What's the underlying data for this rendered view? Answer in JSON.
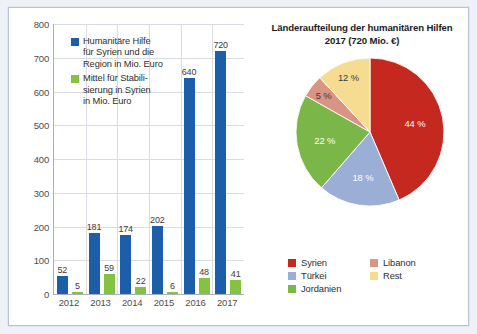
{
  "colors": {
    "blue": "#1c5fa8",
    "green": "#84c341",
    "pie_syrien": "#c4281f",
    "pie_tuerkei": "#9aaed6",
    "pie_jordanien": "#7ab648",
    "pie_libanon": "#d99484",
    "pie_rest": "#f6dc91",
    "grid": "#d9dce2",
    "axis": "#aab0bb"
  },
  "bar_chart": {
    "legend": [
      {
        "key": "humanitaere_hilfe",
        "color_key": "blue",
        "label": "Humanitäre Hilfe\nfür Syrien und die\nRegion in Mio. Euro"
      },
      {
        "key": "stabilisierung",
        "color_key": "green",
        "label": "Mittel für Stabili-\nsierung in Syrien\nin Mio. Euro"
      }
    ],
    "y_ticks": [
      "0",
      "100",
      "200",
      "300",
      "400",
      "500",
      "600",
      "700",
      "800"
    ],
    "x_ticks": [
      "2012",
      "2013",
      "2014",
      "2015",
      "2016",
      "2017"
    ]
  },
  "chart_data": [
    {
      "type": "bar",
      "title": "",
      "xlabel": "",
      "ylabel": "Mio. Euro",
      "ylim": [
        0,
        800
      ],
      "ytick_step": 100,
      "grid": true,
      "legend_position": "inside-top-left",
      "categories": [
        "2012",
        "2013",
        "2014",
        "2015",
        "2016",
        "2017"
      ],
      "series": [
        {
          "name": "Humanitäre Hilfe für Syrien und die Region in Mio. Euro",
          "color": "#1c5fa8",
          "values": [
            52,
            181,
            174,
            202,
            640,
            720
          ],
          "value_labels": [
            "52",
            "181",
            "174",
            "202",
            "640",
            "720"
          ]
        },
        {
          "name": "Mittel für Stabilisierung in Syrien in Mio. Euro",
          "color": "#84c341",
          "values": [
            5,
            59,
            22,
            6,
            48,
            41
          ],
          "value_labels": [
            "5",
            "59",
            "22",
            "6",
            "48",
            "41"
          ]
        }
      ]
    },
    {
      "type": "pie",
      "title": "Länderaufteilung der humanitären Hilfen\n2017 (720 Mio. €)",
      "unit": "%",
      "legend_position": "bottom",
      "start_angle_deg": 0,
      "direction": "clockwise",
      "labels": [
        "Syrien",
        "Türkei",
        "Jordanien",
        "Libanon",
        "Rest"
      ],
      "values": [
        44,
        18,
        22,
        5,
        12
      ],
      "value_labels": [
        "44 %",
        "18 %",
        "22 %",
        "5 %",
        "12 %"
      ],
      "colors": [
        "#c4281f",
        "#9aaed6",
        "#7ab648",
        "#d99484",
        "#f6dc91"
      ],
      "label_text_colors": [
        "#ffffff",
        "#ffffff",
        "#ffffff",
        "#3b3b3b",
        "#3b3b3b"
      ]
    }
  ],
  "pie_chart": {
    "title": "Länderaufteilung der humanitären Hilfen\n2017 (720 Mio. €)",
    "legend_left": [
      {
        "label": "Syrien",
        "color_key": "pie_syrien"
      },
      {
        "label": "Türkei",
        "color_key": "pie_tuerkei"
      },
      {
        "label": "Jordanien",
        "color_key": "pie_jordanien"
      }
    ],
    "legend_right": [
      {
        "label": "Libanon",
        "color_key": "pie_libanon"
      },
      {
        "label": "Rest",
        "color_key": "pie_rest"
      }
    ]
  }
}
